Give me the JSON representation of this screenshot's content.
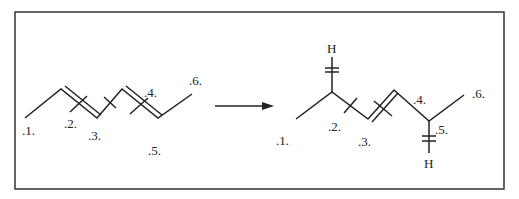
{
  "diagram": {
    "type": "reaction-scheme",
    "colors": {
      "line": "#222222",
      "background": "#ffffff",
      "frame": "#333333"
    },
    "reactant": {
      "name": "hexadiene-skeleton",
      "labels": [
        ".1.",
        ".2.",
        ".3.",
        ".4.",
        ".5.",
        ".6."
      ]
    },
    "arrow": {
      "direction": "right"
    },
    "product": {
      "name": "hexene-with-hydrogens",
      "labels": [
        ".1.",
        ".2.",
        ".3.",
        ".4.",
        ".5.",
        ".6."
      ],
      "hydrogen_top": "H",
      "hydrogen_bottom": "H"
    }
  }
}
